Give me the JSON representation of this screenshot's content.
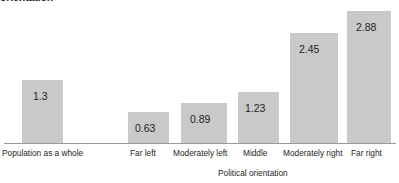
{
  "chart_data": {
    "type": "bar",
    "title": "orientation",
    "xlabel": "Political orientation",
    "ylabel": "",
    "ylim": [
      0,
      3.1
    ],
    "grid": false,
    "legend": "none",
    "categories": [
      "Population as a whole",
      "Far left",
      "Moderately left",
      "Middle",
      "Moderately right",
      "Far right"
    ],
    "values": [
      1.3,
      0.63,
      0.89,
      1.23,
      2.45,
      2.88
    ],
    "value_labels": [
      "1.3",
      "0.63",
      "0.89",
      "1.23",
      "2.45",
      "2.88"
    ],
    "bar_color": "#c9c9c9",
    "axis_color": "#9a9a9a",
    "text_color": "#231f20"
  },
  "bars": [
    {
      "label": "Population as a whole",
      "value_label": "1.3",
      "left": 22,
      "width": 41,
      "top": 80,
      "label_left": 2,
      "value_left": 33
    },
    {
      "label": "Far left",
      "value_label": "0.63",
      "left": 128,
      "width": 41,
      "top": 112,
      "label_left": 130,
      "value_left": 135
    },
    {
      "label": "Moderately left",
      "value_label": "0.89",
      "left": 181,
      "width": 46,
      "top": 103,
      "label_left": 173,
      "value_left": 190
    },
    {
      "label": "Middle",
      "value_label": "1.23",
      "left": 238,
      "width": 41,
      "top": 92,
      "label_left": 243,
      "value_left": 245
    },
    {
      "label": "Moderately right",
      "value_label": "2.45",
      "left": 290,
      "width": 48,
      "top": 33,
      "label_left": 283,
      "value_left": 299
    },
    {
      "label": "Far right",
      "value_label": "2.88",
      "left": 347,
      "width": 44,
      "top": 11,
      "label_left": 351,
      "value_left": 356
    }
  ],
  "axis_title_left": 218
}
